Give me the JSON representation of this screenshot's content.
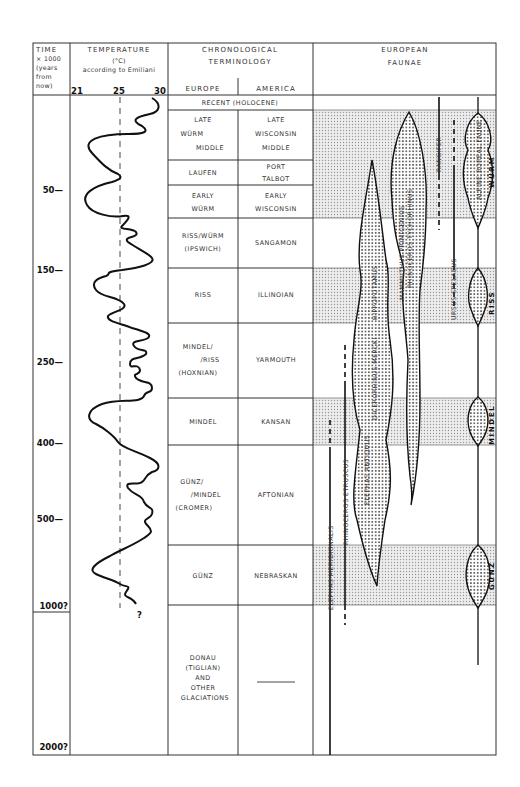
{
  "header": {
    "time": [
      "TIME",
      "× 1000",
      "(years",
      "from",
      "now)"
    ],
    "temperature": {
      "title": "TEMPERATURE",
      "unit": "(°C)",
      "source": "according to Emiliani",
      "scale": [
        "21",
        "25",
        "30"
      ]
    },
    "chronology": {
      "title_line1": "CHRONOLOGICAL",
      "title_line2": "TERMINOLOGY",
      "col_europe": "EUROPE",
      "col_america": "AMERICA"
    },
    "faunae": {
      "title_line1": "EUROPEAN",
      "title_line2": "FAUNAE"
    }
  },
  "time_ticks": [
    {
      "label": "50—",
      "y": 193
    },
    {
      "label": "150—",
      "y": 273
    },
    {
      "label": "250—",
      "y": 365
    },
    {
      "label": "400—",
      "y": 446
    },
    {
      "label": "500—",
      "y": 522
    },
    {
      "label": "1000?",
      "y": 609
    },
    {
      "label": "2000?",
      "y": 750
    }
  ],
  "temperature_curve": {
    "reference_line": "25",
    "end_marker": "?"
  },
  "chronology_rows": [
    {
      "europe": [
        "RECENT (HOLOCENE)"
      ],
      "america": [],
      "span": true
    },
    {
      "europe": [
        "LATE",
        "WÜRM",
        "MIDDLE"
      ],
      "america": [
        "LATE",
        "WISCONSIN",
        "MIDDLE"
      ]
    },
    {
      "europe": [
        "LAUFEN"
      ],
      "america": [
        "PORT",
        "TALBOT"
      ]
    },
    {
      "europe": [
        "EARLY",
        "WÜRM"
      ],
      "america": [
        "EARLY",
        "WISCONSIN"
      ]
    },
    {
      "europe": [
        "RISS/WÜRM",
        "(IPSWICH)"
      ],
      "america": [
        "SANGAMON"
      ]
    },
    {
      "europe": [
        "RISS"
      ],
      "america": [
        "ILLINOIAN"
      ]
    },
    {
      "europe": [
        "MINDEL/",
        "/RISS",
        "(HOXNIAN)"
      ],
      "america": [
        "YARMOUTH"
      ]
    },
    {
      "europe": [
        "MINDEL"
      ],
      "america": [
        "KANSAN"
      ]
    },
    {
      "europe": [
        "GÜNZ/",
        "/MINDEL",
        "(CROMER)"
      ],
      "america": [
        "AFTONIAN"
      ]
    },
    {
      "europe": [
        "GÜNZ"
      ],
      "america": [
        "NEBRASKAN"
      ]
    },
    {
      "europe": [
        "DONAU",
        "(TIGLIAN)",
        "AND",
        "OTHER",
        "GLACIATIONS"
      ],
      "america": [
        "———"
      ]
    }
  ],
  "glacial_labels": [
    "WÜRM",
    "RISS",
    "MINDEL",
    "GÜNZ"
  ],
  "faunae_labels": [
    "ELEPHAS MERIDIONALIS",
    "RHINOCEROS ETRUSCUS",
    "ELEPHAS ANTIQUUS",
    "DICERORHINUS MERCKI",
    "HIPPOPOTAMUS",
    "MAMMUTHUS PRIMIGENIUS",
    "RHINOCEROS TYCHORHINUS",
    "RANGIFER",
    "URSUS SPELAEUS",
    "ALPINE BOREAL FAUNE"
  ],
  "colors": {
    "line": "#222222",
    "stipple_band": "#cfcfcf",
    "stipple_dot": "#333333",
    "background": "#ffffff"
  }
}
